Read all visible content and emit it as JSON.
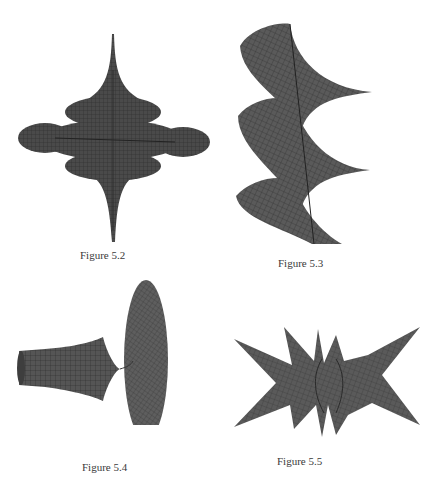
{
  "page": {
    "figures": [
      {
        "id": "5.2",
        "caption": "Figure 5.2",
        "subject": "spiky-disc-surface"
      },
      {
        "id": "5.3",
        "caption": "Figure 5.3",
        "subject": "helicoidal-twisted-surface"
      },
      {
        "id": "5.4",
        "caption": "Figure 5.4",
        "subject": "horn-and-disc-surface"
      },
      {
        "id": "5.5",
        "caption": "Figure 5.5",
        "subject": "star-shaped-surface"
      }
    ],
    "colors": {
      "surface": "#4a4a4a",
      "mesh": "#2a2a2a",
      "background": "#ffffff"
    }
  }
}
